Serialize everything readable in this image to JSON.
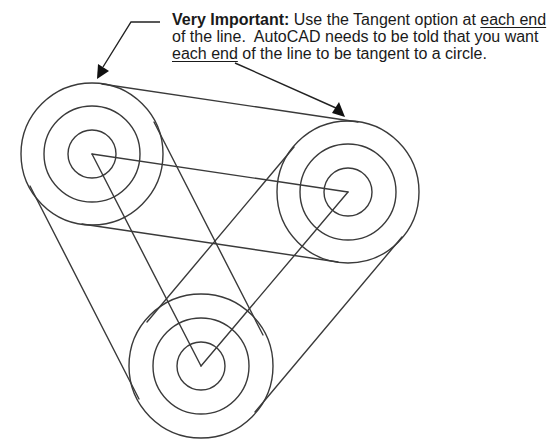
{
  "callout": {
    "bold_label": "Very Important:",
    "line1_text": " Use the Tangent option at ",
    "line1_underlined": "each end",
    "line2_text": "of the line.  AutoCAD needs to be told that you want",
    "line3_underlined": "each end",
    "line3_text": " of the line to be tangent to a circle."
  },
  "colors": {
    "stroke": "#3a3a3a",
    "text": "#1a1a1a",
    "background": "#ffffff"
  },
  "geometry": {
    "circles": [
      {
        "name": "circle-top-left",
        "cx": 92,
        "cy": 154,
        "radii": [
          71,
          48,
          24
        ]
      },
      {
        "name": "circle-right",
        "cx": 348,
        "cy": 192,
        "radii": [
          71,
          48,
          24
        ]
      },
      {
        "name": "circle-bottom",
        "cx": 201,
        "cy": 366,
        "radii": [
          71,
          48,
          24
        ]
      }
    ],
    "tangent_lines": [
      {
        "name": "tangent-top",
        "x1": 102,
        "y1": 84,
        "x2": 358,
        "y2": 122
      },
      {
        "name": "tangent-ab-lower",
        "x1": 82,
        "y1": 224,
        "x2": 338,
        "y2": 262
      },
      {
        "name": "tangent-right-outer",
        "x1": 402,
        "y1": 237,
        "x2": 255,
        "y2": 412
      },
      {
        "name": "tangent-bc-inner",
        "x1": 294,
        "y1": 147,
        "x2": 147,
        "y2": 322
      },
      {
        "name": "tangent-left-outer",
        "x1": 30,
        "y1": 186,
        "x2": 139,
        "y2": 399
      },
      {
        "name": "tangent-ac-inner",
        "x1": 154,
        "y1": 122,
        "x2": 263,
        "y2": 335
      }
    ],
    "center_lines": [
      {
        "name": "center-line-a-b",
        "x1": 92,
        "y1": 154,
        "x2": 348,
        "y2": 192
      },
      {
        "name": "center-line-b-c",
        "x1": 348,
        "y1": 192,
        "x2": 201,
        "y2": 366
      },
      {
        "name": "center-line-c-a",
        "x1": 201,
        "y1": 366,
        "x2": 92,
        "y2": 154
      }
    ],
    "leaders": [
      {
        "name": "leader-left",
        "points": "160,22 131,22 100,72",
        "arrow_tip": [
          97,
          79
        ]
      },
      {
        "name": "leader-right",
        "points": "235,63 338,109",
        "arrow_tip": [
          345,
          117
        ]
      }
    ]
  }
}
